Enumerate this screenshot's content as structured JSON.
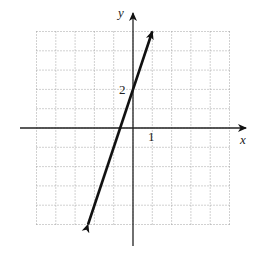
{
  "chart_data": {
    "type": "line",
    "title": "",
    "xlabel": "x",
    "ylabel": "y",
    "xlim": [
      -5,
      5
    ],
    "ylim": [
      -5,
      5
    ],
    "grid": true,
    "grid_style": "dotted",
    "tick_labels": {
      "x": [
        "1"
      ],
      "y": [
        "2"
      ]
    },
    "series": [
      {
        "name": "y = 3x + 2",
        "slope": 3,
        "intercept": 2,
        "x": [
          -2.33,
          1
        ],
        "y": [
          -5,
          5
        ],
        "arrows": "both"
      }
    ]
  },
  "labels": {
    "x_axis": "x",
    "y_axis": "y",
    "x_tick": "1",
    "y_tick": "2"
  }
}
